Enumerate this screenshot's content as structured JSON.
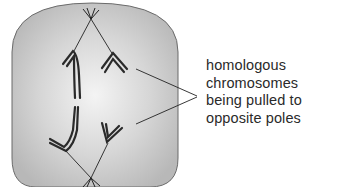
{
  "diagram": {
    "cell": {
      "fill_center": "#f2f2f2",
      "fill_edge": "#bdbdbd",
      "outline": "#6b6b6b"
    },
    "annotation": {
      "lines": [
        "homologous",
        "chromosomes",
        "being pulled to",
        "opposite poles"
      ],
      "text_color": "#2a2a2a"
    },
    "elements": [
      {
        "name": "top-pole-centriole",
        "type": "spindle pole",
        "x": 91,
        "y": 18
      },
      {
        "name": "bottom-pole-centriole",
        "type": "spindle pole",
        "x": 91,
        "y": 178
      },
      {
        "name": "left-top-chromosome",
        "type": "chromosome (long, moving up)"
      },
      {
        "name": "left-bottom-chromosome",
        "type": "chromosome (long, moving down)"
      },
      {
        "name": "right-top-chromosome",
        "type": "chromosome (short V, moving up)"
      },
      {
        "name": "right-bottom-chromosome",
        "type": "chromosome (short V, moving down)"
      }
    ]
  }
}
